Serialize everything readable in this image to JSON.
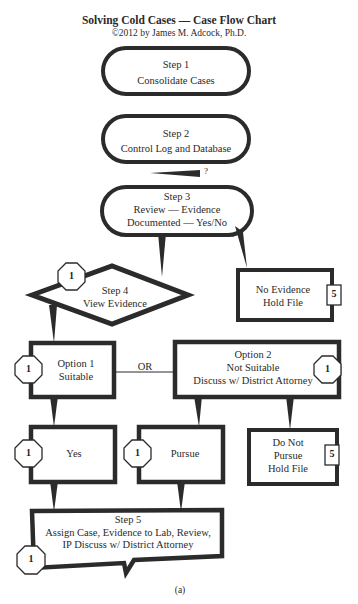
{
  "header": {
    "title": "Solving Cold Cases — Case Flow Chart",
    "copyright": "©2012 by James M. Adcock, Ph.D."
  },
  "nodes": {
    "step1": {
      "line1": "Step 1",
      "line2": "Consolidate Cases"
    },
    "step2": {
      "line1": "Step 2",
      "line2": "Control Log and Database"
    },
    "question_mark": "?",
    "step3": {
      "line1": "Step 3",
      "line2": "Review — Evidence",
      "line3": "Documented — Yes/No"
    },
    "step4": {
      "line1": "Step 4",
      "line2": "View Evidence",
      "badge": "1"
    },
    "no_evidence": {
      "line1": "No Evidence",
      "line2": "Hold File",
      "badge": "5"
    },
    "option1": {
      "line1": "Option 1",
      "line2": "Suitable",
      "badge": "1"
    },
    "or_label": "OR",
    "option2": {
      "line1": "Option 2",
      "line2": "Not Suitable",
      "line3": "Discuss w/ District Attorney",
      "badge": "1"
    },
    "yes": {
      "label": "Yes",
      "badge": "1"
    },
    "pursue": {
      "label": "Pursue",
      "badge": "1"
    },
    "do_not_pursue": {
      "line1": "Do Not",
      "line2": "Pursue",
      "line3": "Hold File",
      "badge": "5"
    },
    "step5": {
      "line1": "Step 5",
      "line2": "Assign Case, Evidence to Lab, Review,",
      "line3": "IP Discuss w/ District Attorney",
      "badge": "1"
    }
  },
  "footer": {
    "caption": "(a)"
  },
  "colors": {
    "stroke": "#2b2b2b",
    "text": "#2a2a2a",
    "background": "#ffffff"
  }
}
